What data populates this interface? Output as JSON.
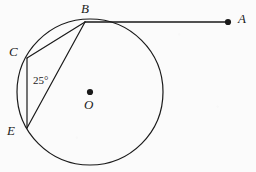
{
  "figure": {
    "type": "circle-geometry-diagram",
    "background_color": "#fbfbfb",
    "stroke_color": "#1a1a1a",
    "labels": {
      "point_a": "A",
      "point_b": "B",
      "point_c": "C",
      "point_e": "E",
      "center_o": "O",
      "angle_at_e": "25°"
    },
    "geometry": {
      "circle": {
        "cx": 90,
        "cy": 92,
        "r": 73
      },
      "points": {
        "A": {
          "x": 228,
          "y": 22
        },
        "B": {
          "x": 85,
          "y": 22
        },
        "C": {
          "x": 27,
          "y": 58
        },
        "E": {
          "x": 27,
          "y": 128
        },
        "O": {
          "x": 90,
          "y": 92
        }
      },
      "segments": [
        {
          "name": "tangent-BA",
          "from": "B",
          "to": "A"
        },
        {
          "name": "chord-BC",
          "from": "B",
          "to": "C"
        },
        {
          "name": "chord-BE",
          "from": "B",
          "to": "E"
        },
        {
          "name": "chord-CE",
          "from": "C",
          "to": "E"
        }
      ],
      "marked_angle": {
        "vertex": "E",
        "rays": [
          "C",
          "B"
        ],
        "value": "25°"
      }
    },
    "label_positions": {
      "A": {
        "x": 238,
        "y": 12
      },
      "B": {
        "x": 81,
        "y": 2
      },
      "C": {
        "x": 9,
        "y": 45
      },
      "E": {
        "x": 7,
        "y": 124
      },
      "O": {
        "x": 84,
        "y": 98
      },
      "angle": {
        "x": 33,
        "y": 75
      }
    }
  }
}
